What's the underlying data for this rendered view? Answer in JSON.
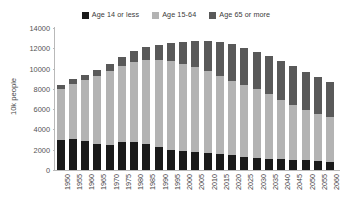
{
  "chart_data": {
    "type": "bar",
    "stacked": true,
    "title": "",
    "xlabel": "",
    "ylabel": "10k people",
    "ylim": [
      0,
      14000
    ],
    "ytick_values": [
      0,
      2000,
      4000,
      6000,
      8000,
      10000,
      12000,
      14000
    ],
    "ytick_labels": [
      "0",
      "2000",
      "4000",
      "6000",
      "8000",
      "10000",
      "12000",
      "14000"
    ],
    "grid": false,
    "legend_position": "top-center",
    "categories": [
      "1950",
      "1955",
      "1960",
      "1965",
      "1970",
      "1975",
      "1980",
      "1985",
      "1990",
      "1995",
      "2000",
      "2005",
      "2010",
      "2015",
      "2020",
      "2025",
      "2030",
      "2035",
      "2040",
      "2045",
      "2050",
      "2055",
      "2060"
    ],
    "series": [
      {
        "name": "Age 14 or less",
        "color": "#1a1a1a",
        "values": [
          2979,
          3012,
          2843,
          2553,
          2515,
          2722,
          2751,
          2603,
          2249,
          2001,
          1847,
          1752,
          1684,
          1583,
          1457,
          1324,
          1204,
          1129,
          1073,
          1012,
          939,
          861,
          791
        ]
      },
      {
        "name": "Age 15-64",
        "color": "#b3b3b3",
        "values": [
          4966,
          5473,
          6000,
          6693,
          7212,
          7581,
          7883,
          8251,
          8590,
          8716,
          8622,
          8409,
          8103,
          7682,
          7341,
          7085,
          6773,
          6343,
          5787,
          5353,
          5001,
          4706,
          4418
        ]
      },
      {
        "name": "Age 65 or more",
        "color": "#595959",
        "values": [
          411,
          475,
          535,
          618,
          733,
          887,
          1065,
          1247,
          1489,
          1826,
          2201,
          2576,
          2925,
          3387,
          3612,
          3657,
          3685,
          3741,
          3868,
          3856,
          3768,
          3626,
          3464
        ]
      }
    ],
    "totals": [
      8356,
      8960,
      9378,
      9864,
      10460,
      11190,
      11699,
      12101,
      12328,
      12543,
      12670,
      12737,
      12712,
      12652,
      12410,
      12066,
      11662,
      11213,
      10728,
      10221,
      9708,
      9193,
      8673
    ]
  },
  "legend": {
    "items": [
      {
        "label": "Age 14 or less",
        "color": "#1a1a1a"
      },
      {
        "label": "Age 15-64",
        "color": "#b3b3b3"
      },
      {
        "label": "Age 65 or more",
        "color": "#595959"
      }
    ]
  }
}
